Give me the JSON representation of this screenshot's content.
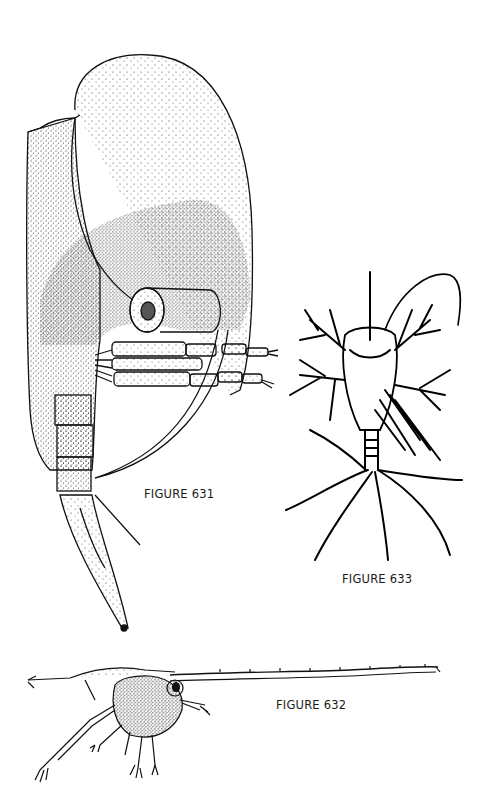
{
  "plate": {
    "figures": [
      {
        "id": "631",
        "label": "FIGURE 631",
        "subject": "cladoceran-lateral-view"
      },
      {
        "id": "632",
        "label": "FIGURE 632",
        "subject": "crustacean-larva-lateral-view-with-long-rostrum"
      },
      {
        "id": "633",
        "label": "FIGURE 633",
        "subject": "nauplius-dorsal-view-with-setae"
      }
    ]
  },
  "colors": {
    "background": "#ffffff",
    "ink": "#111111",
    "stipple": "#333333"
  }
}
